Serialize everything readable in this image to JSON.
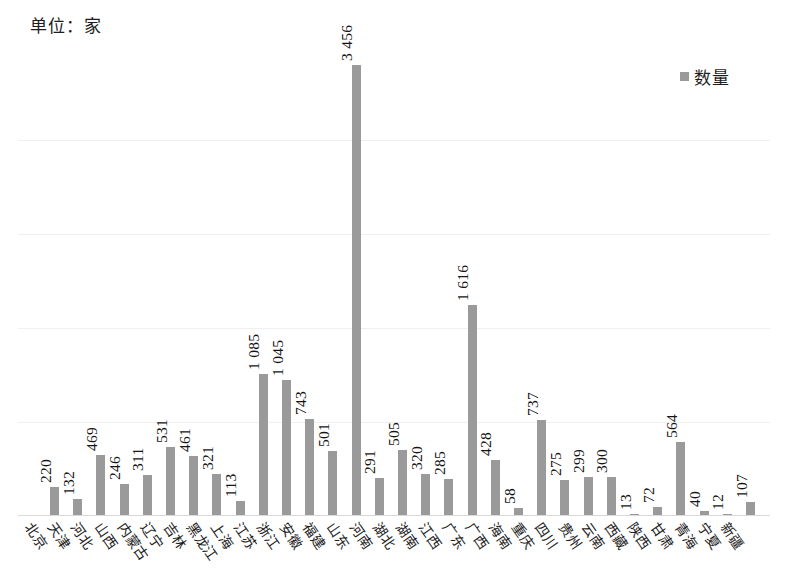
{
  "unit_caption": "单位：家",
  "legend": {
    "label": "数量",
    "swatch_color": "#9a9a9a"
  },
  "chart_data": {
    "type": "bar",
    "title": "",
    "subtitle": "",
    "xlabel": "",
    "ylabel": "",
    "unit": "单位：家",
    "grid": true,
    "legend_position": "top-right",
    "series_name": "数量",
    "bar_color": "#9a9a9a",
    "ylim": [
      0,
      3600
    ],
    "gridline_values": [
      720,
      1440,
      2160,
      2880
    ],
    "thousands_separator": " ",
    "categories": [
      "北京",
      "天津",
      "河北",
      "山西",
      "内蒙古",
      "辽宁",
      "吉林",
      "黑龙江",
      "上海",
      "江苏",
      "浙江",
      "安徽",
      "福建",
      "山东",
      "河南",
      "湖北",
      "湖南",
      "江西",
      "广东",
      "广西",
      "海南",
      "重庆",
      "四川",
      "贵州",
      "云南",
      "西藏",
      "陕西",
      "甘肃",
      "青海",
      "宁夏",
      "新疆"
    ],
    "values": [
      220,
      132,
      469,
      246,
      311,
      531,
      461,
      321,
      113,
      1085,
      1045,
      743,
      501,
      3456,
      291,
      505,
      320,
      285,
      1616,
      428,
      58,
      737,
      275,
      299,
      300,
      13,
      72,
      564,
      40,
      12,
      107
    ],
    "value_labels": [
      "220",
      "132",
      "469",
      "246",
      "311",
      "531",
      "461",
      "321",
      "113",
      "1 085",
      "1 045",
      "743",
      "501",
      "3 456",
      "291",
      "505",
      "320",
      "285",
      "1 616",
      "428",
      "58",
      "737",
      "275",
      "299",
      "300",
      "13",
      "72",
      "564",
      "40",
      "12",
      "107"
    ]
  }
}
